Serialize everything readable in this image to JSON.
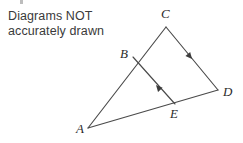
{
  "note": {
    "text": "Diagrams NOT\naccurately drawn",
    "color": "#3a3a3a"
  },
  "figure": {
    "stroke_color": "#4a4a4a",
    "label_color": "#2b2b2b",
    "background": "#ffffff",
    "vertices": [
      {
        "name": "A",
        "label": "A",
        "x": 88,
        "y": 128,
        "label_x": 76,
        "label_y": 133
      },
      {
        "name": "B",
        "label": "B",
        "x": 133,
        "y": 57,
        "label_x": 120,
        "label_y": 58
      },
      {
        "name": "C",
        "label": "C",
        "x": 166,
        "y": 27,
        "label_x": 161,
        "label_y": 18
      },
      {
        "name": "D",
        "label": "D",
        "x": 218,
        "y": 90,
        "label_x": 223,
        "label_y": 96
      },
      {
        "name": "E",
        "label": "E",
        "x": 175,
        "y": 104,
        "label_x": 170,
        "label_y": 118
      }
    ],
    "edges": [
      {
        "name": "edge-A-C",
        "from": "A",
        "to": "C",
        "path": "M 88 128 L 166 27"
      },
      {
        "name": "edge-C-D",
        "from": "C",
        "to": "D",
        "path": "M 166 27 L 218 90"
      },
      {
        "name": "edge-A-D",
        "from": "A",
        "to": "D",
        "path": "M 88 128 L 218 90"
      },
      {
        "name": "edge-B-E",
        "from": "B",
        "to": "E",
        "path": "M 133 57 L 175 104"
      }
    ],
    "arrow_marks": [
      {
        "name": "arrow-on-CD",
        "on_edge": "edge-C-D",
        "x": 192,
        "y": 59,
        "angle": 50,
        "direction": "toward-D"
      },
      {
        "name": "arrow-on-EB",
        "on_edge": "edge-B-E",
        "x": 156,
        "y": 85,
        "angle": 228,
        "direction": "toward-B"
      }
    ]
  }
}
